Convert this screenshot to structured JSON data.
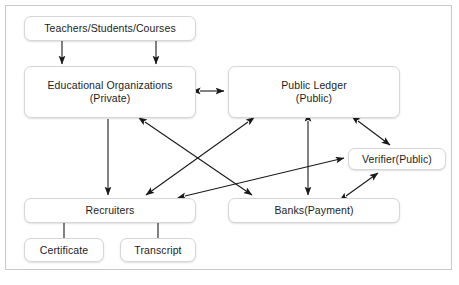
{
  "diagram": {
    "frame": {
      "stroke": "#c9c9c9"
    },
    "node_style": {
      "fill": "#ffffff",
      "stroke": "#d6d6d6",
      "text": "#1d1d1d"
    },
    "edge_style": {
      "stroke": "#1a1a1a"
    },
    "nodes": [
      {
        "id": "teachers",
        "label": "Teachers/Students/Courses",
        "x": 24,
        "y": 16,
        "w": 172,
        "h": 25
      },
      {
        "id": "eduorg",
        "label": "Educational Organizations\n(Private)",
        "x": 24,
        "y": 66,
        "w": 172,
        "h": 52
      },
      {
        "id": "ledger",
        "label": "Public Ledger\n(Public)",
        "x": 228,
        "y": 66,
        "w": 172,
        "h": 52
      },
      {
        "id": "verifier",
        "label": "Verifier(Public)",
        "x": 348,
        "y": 148,
        "w": 98,
        "h": 22
      },
      {
        "id": "recruiters",
        "label": "Recruiters",
        "x": 24,
        "y": 198,
        "w": 172,
        "h": 25
      },
      {
        "id": "banks",
        "label": "Banks(Payment)",
        "x": 228,
        "y": 198,
        "w": 172,
        "h": 25
      },
      {
        "id": "certificate",
        "label": "Certificate",
        "x": 24,
        "y": 238,
        "w": 80,
        "h": 24
      },
      {
        "id": "transcript",
        "label": "Transcript",
        "x": 120,
        "y": 238,
        "w": 76,
        "h": 24
      }
    ],
    "edges": [
      {
        "id": "teachers-eduorg-left",
        "from": "teachers",
        "to": "eduorg",
        "arrows": "end"
      },
      {
        "id": "teachers-eduorg-right",
        "from": "teachers",
        "to": "eduorg",
        "arrows": "end"
      },
      {
        "id": "eduorg-ledger",
        "from": "eduorg",
        "to": "ledger",
        "arrows": "both"
      },
      {
        "id": "eduorg-recruiters",
        "from": "eduorg",
        "to": "recruiters",
        "arrows": "end"
      },
      {
        "id": "eduorg-banks",
        "from": "eduorg",
        "to": "banks",
        "arrows": "both"
      },
      {
        "id": "ledger-recruiters",
        "from": "ledger",
        "to": "recruiters",
        "arrows": "both"
      },
      {
        "id": "ledger-banks",
        "from": "ledger",
        "to": "banks",
        "arrows": "both"
      },
      {
        "id": "ledger-verifier",
        "from": "ledger",
        "to": "verifier",
        "arrows": "both"
      },
      {
        "id": "recruiters-verifier",
        "from": "recruiters",
        "to": "verifier",
        "arrows": "both"
      },
      {
        "id": "banks-verifier",
        "from": "banks",
        "to": "verifier",
        "arrows": "both"
      },
      {
        "id": "recruiters-certificate",
        "from": "recruiters",
        "to": "certificate",
        "arrows": "none"
      },
      {
        "id": "recruiters-transcript",
        "from": "recruiters",
        "to": "transcript",
        "arrows": "none"
      }
    ]
  }
}
